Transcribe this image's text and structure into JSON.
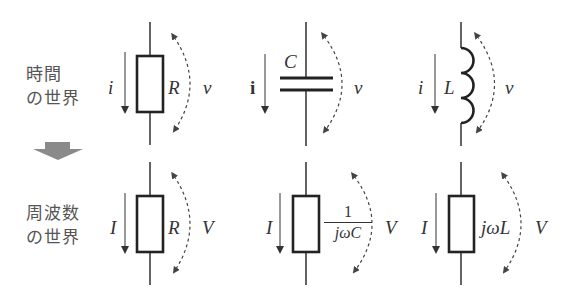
{
  "colors": {
    "line": "#222222",
    "dashed_arrow": "#444444",
    "label_text": "#333333",
    "caption_text": "#555555",
    "block_arrow": "#8a8a8a"
  },
  "captions": {
    "time_domain": "時間\nの世界",
    "frequency_domain": "周波数\nの世界"
  },
  "transition_arrow": {
    "icon": "down-block-arrow-icon",
    "meaning": "time-to-frequency"
  },
  "time_domain": {
    "resistor": {
      "current": "i",
      "element": "R",
      "voltage": "v"
    },
    "capacitor": {
      "current": "i",
      "element": "C",
      "voltage": "v"
    },
    "inductor": {
      "current": "i",
      "element": "L",
      "voltage": "v"
    }
  },
  "frequency_domain": {
    "resistor": {
      "current": "I",
      "impedance": "R",
      "voltage": "V"
    },
    "capacitor": {
      "current": "I",
      "impedance_num": "1",
      "impedance_den": "jωC",
      "voltage": "V"
    },
    "inductor": {
      "current": "I",
      "impedance": "jωL",
      "voltage": "V"
    }
  }
}
